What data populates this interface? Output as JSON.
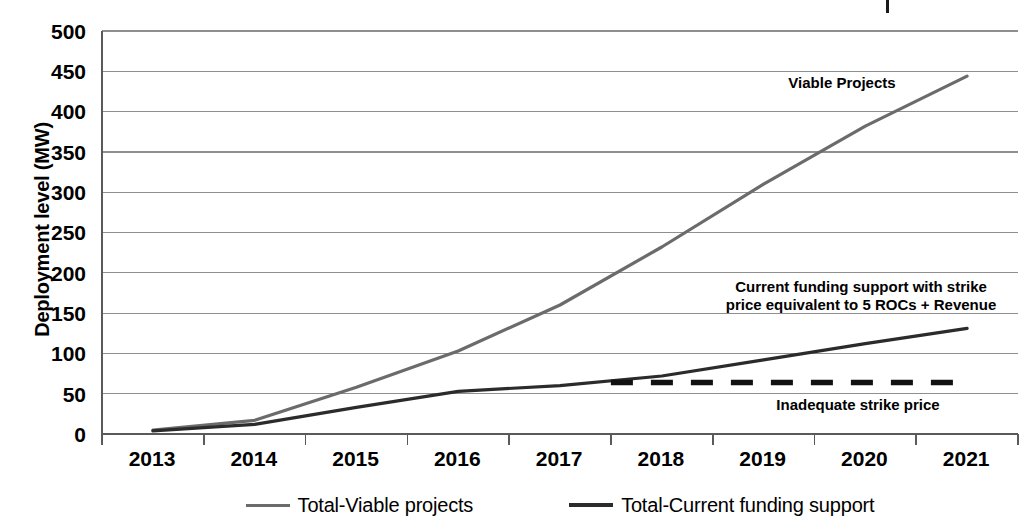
{
  "chart_data": {
    "type": "line",
    "title": "",
    "xlabel": "",
    "ylabel": "Deployment level (MW)",
    "categories": [
      "2013",
      "2014",
      "2015",
      "2016",
      "2017",
      "2018",
      "2019",
      "2020",
      "2021"
    ],
    "ylim": [
      0,
      500
    ],
    "ytick_values": [
      0,
      50,
      100,
      150,
      200,
      250,
      300,
      350,
      400,
      450,
      500
    ],
    "ytick_labels": [
      "0",
      "50",
      "100",
      "150",
      "200",
      "250",
      "300",
      "350",
      "400",
      "450",
      "500"
    ],
    "grid": true,
    "grid_axis": "y",
    "legend_position": "bottom",
    "series": [
      {
        "name": "Total-Viable projects",
        "label": "Total-Viable projects",
        "color": "#6b6b6b",
        "linewidth": 3,
        "linestyle": "solid",
        "values": [
          5,
          17,
          58,
          103,
          160,
          232,
          310,
          382,
          444
        ]
      },
      {
        "name": "Total-Current funding support",
        "label": "Total-Current funding support",
        "color": "#2b2b2b",
        "linewidth": 3,
        "linestyle": "solid",
        "values": [
          4,
          12,
          33,
          53,
          60,
          72,
          92,
          112,
          131
        ]
      },
      {
        "name": "Inadequate strike price",
        "label": "Inadequate strike price",
        "color": "#111111",
        "linewidth": 5,
        "linestyle": "dashed",
        "x_start": "2017.5",
        "x_end": "2021",
        "values": [
          null,
          null,
          null,
          null,
          64,
          64,
          64,
          64,
          64
        ]
      }
    ],
    "annotations": [
      {
        "name": "viable-projects",
        "text": "Viable Projects"
      },
      {
        "name": "current-funding-support",
        "text": "Current funding support with strike\nprice equivalent to 5 ROCs + Revenue"
      },
      {
        "name": "inadequate-strike-price",
        "text": "Inadequate strike price"
      }
    ],
    "colors": {
      "viable": "#6b6b6b",
      "current": "#2b2b2b",
      "dashed": "#111111",
      "grid": "#8f8f8f",
      "axis": "#5a5a5a",
      "text": "#000000",
      "background": "#ffffff"
    }
  },
  "legend": {
    "items": [
      {
        "label": "Total-Viable projects",
        "color": "#6b6b6b"
      },
      {
        "label": "Total-Current funding support",
        "color": "#2b2b2b"
      }
    ]
  }
}
